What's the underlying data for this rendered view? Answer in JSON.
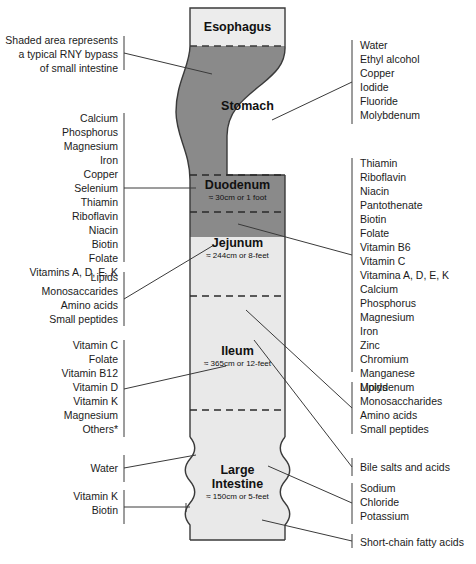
{
  "diagram": {
    "colors": {
      "shaded_dark": "#8a8a8a",
      "light_fill": "#e9e9e9",
      "outline": "#3a3a3a",
      "text": "#1b1b1b",
      "background": "#ffffff"
    }
  },
  "note": {
    "lines": [
      "Shaded area represents",
      "a typical RNY bypass",
      "of small intestine"
    ]
  },
  "organs": [
    {
      "id": "esophagus",
      "name": "Esophagus",
      "sub": ""
    },
    {
      "id": "stomach",
      "name": "Stomach",
      "sub": ""
    },
    {
      "id": "duodenum",
      "name": "Duodenum",
      "sub": "≈ 30cm or 1 foot"
    },
    {
      "id": "jejunum",
      "name": "Jejunum",
      "sub": "≈ 244cm or 8-feet"
    },
    {
      "id": "ileum",
      "name": "Ileum",
      "sub": "≈ 365cm or 12-feet"
    },
    {
      "id": "large-intestine",
      "name_line1": "Large",
      "name_line2": "Intestine",
      "sub": "≈ 150cm or 5-feet"
    }
  ],
  "left_annotations": [
    {
      "id": "duodenum-nutrients",
      "items": [
        "Calcium",
        "Phosphorus",
        "Magnesium",
        "Iron",
        "Copper",
        "Selenium",
        "Thiamin",
        "Riboflavin",
        "Niacin",
        "Biotin",
        "Folate",
        "Vitamins A, D, E, K"
      ]
    },
    {
      "id": "jejunum-macronutrients",
      "items": [
        "Lipids",
        "Monosaccarides",
        "Amino acids",
        "Small peptides"
      ]
    },
    {
      "id": "ileum-nutrients",
      "items": [
        "Vitamin C",
        "Folate",
        "Vitamin B12",
        "Vitamin D",
        "Vitamin K",
        "Magnesium",
        "Others*"
      ]
    },
    {
      "id": "large-intestine-water",
      "items": [
        "Water"
      ]
    },
    {
      "id": "large-intestine-vitamins",
      "items": [
        "Vitamin K",
        "Biotin"
      ]
    }
  ],
  "right_annotations": [
    {
      "id": "stomach-absorption",
      "items": [
        "Water",
        "Ethyl alcohol",
        "Copper",
        "Iodide",
        "Fluoride",
        "Molybdenum"
      ]
    },
    {
      "id": "jejunum-micronutrients",
      "items": [
        "Thiamin",
        "Riboflavin",
        "Niacin",
        "Pantothenate",
        "Biotin",
        "Folate",
        "Vitamin B6",
        "Vitamin C",
        "Vitamina A, D, E, K",
        "Calcium",
        "Phosphorus",
        "Magnesium",
        "Iron",
        "Zinc",
        "Chromium",
        "Manganese",
        "Molydenum"
      ]
    },
    {
      "id": "ileum-macronutrients",
      "items": [
        "Lipids",
        "Monosaccharides",
        "Amino acids",
        "Small peptides"
      ]
    },
    {
      "id": "ileum-bile",
      "items": [
        "Bile salts and acids"
      ]
    },
    {
      "id": "large-intestine-electrolytes",
      "items": [
        "Sodium",
        "Chloride",
        "Potassium"
      ]
    },
    {
      "id": "large-intestine-scfa",
      "items": [
        "Short-chain fatty acids"
      ]
    }
  ]
}
